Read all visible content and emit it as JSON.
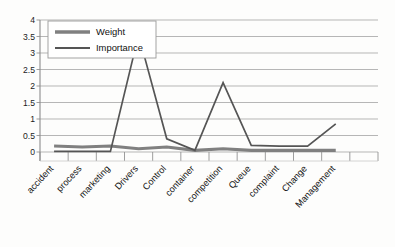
{
  "chart_data": {
    "type": "line",
    "title": "",
    "subtitle": "",
    "xlabel": "",
    "ylabel": "",
    "categories": [
      "accident",
      "process",
      "marketing",
      "Drivers",
      "Control",
      "container",
      "competition",
      "Queue",
      "complaint",
      "Change",
      "Management"
    ],
    "yticklabels": [
      "4",
      "3.5",
      "3",
      "2.5",
      "2",
      "1.5",
      "1",
      "0.5",
      "0"
    ],
    "ytickvalues": [
      4,
      3.5,
      3,
      2.5,
      2,
      1.5,
      1,
      0.5,
      0
    ],
    "ylim": [
      0,
      4
    ],
    "grid": "horizontal",
    "legend_position": "upper-left-inside",
    "series": [
      {
        "name": "Weight",
        "color": "#808080",
        "linewidth": 3.1,
        "values": [
          0.18,
          0.15,
          0.18,
          0.1,
          0.15,
          0.05,
          0.1,
          0.05,
          0.05,
          0.05,
          0.05
        ]
      },
      {
        "name": "Importance",
        "color": "#555555",
        "linewidth": 1.7,
        "values": [
          0.02,
          0.02,
          0.02,
          3.55,
          0.4,
          0.05,
          2.1,
          0.2,
          0.18,
          0.18,
          0.85
        ]
      }
    ]
  },
  "legend": {
    "entries": [
      {
        "label": "Weight"
      },
      {
        "label": "Importance"
      }
    ]
  },
  "colors": {
    "weight": "#808080",
    "importance": "#555555",
    "grid": "#a9a9a9",
    "axis": "#8c8c8c",
    "text": "#141414",
    "background": "#fdfdfc"
  }
}
